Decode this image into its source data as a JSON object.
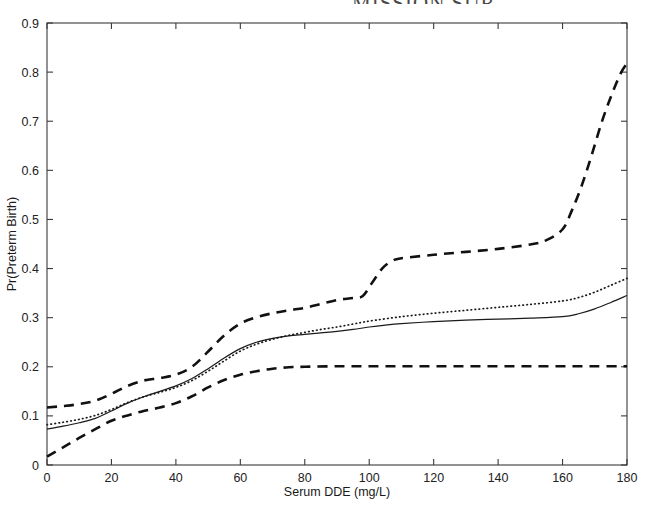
{
  "figure": {
    "cut_off_header": "MISSION SUR",
    "background_color": "#ffffff",
    "axis_color": "#3a3a3a"
  },
  "chart_data": {
    "type": "line",
    "title": "",
    "xlabel": "Serum DDE (mg/L)",
    "ylabel": "Pr(Preterm Birth)",
    "xlim": [
      0,
      180
    ],
    "ylim": [
      0,
      0.9
    ],
    "xticks": [
      0,
      20,
      40,
      60,
      80,
      100,
      120,
      140,
      160,
      180
    ],
    "xtick_labels": [
      "0",
      "20",
      "40",
      "60",
      "80",
      "100",
      "120",
      "140",
      "160",
      "180"
    ],
    "yticks": [
      0,
      0.1,
      0.2,
      0.3,
      0.4,
      0.5,
      0.6,
      0.7,
      0.8,
      0.9
    ],
    "ytick_labels": [
      "0",
      "0.1",
      "0.2",
      "0.3",
      "0.4",
      "0.5",
      "0.6",
      "0.7",
      "0.8",
      "0.9"
    ],
    "grid": false,
    "legend": false,
    "legend_position": "none",
    "series": [
      {
        "name": "Estimated dose-response (solid)",
        "style": "solid",
        "color": "#1a1a1a",
        "x": [
          0,
          5,
          10,
          15,
          20,
          25,
          30,
          35,
          40,
          45,
          50,
          55,
          60,
          65,
          70,
          75,
          80,
          85,
          90,
          95,
          100,
          105,
          110,
          120,
          130,
          140,
          150,
          160,
          165,
          170,
          175,
          180
        ],
        "y": [
          0.073,
          0.079,
          0.086,
          0.095,
          0.11,
          0.126,
          0.139,
          0.15,
          0.161,
          0.176,
          0.196,
          0.218,
          0.237,
          0.25,
          0.258,
          0.263,
          0.266,
          0.269,
          0.272,
          0.276,
          0.281,
          0.285,
          0.288,
          0.292,
          0.295,
          0.297,
          0.299,
          0.302,
          0.308,
          0.318,
          0.331,
          0.345
        ]
      },
      {
        "name": "Alternative estimate (dotted)",
        "style": "dotted",
        "color": "#1a1a1a",
        "x": [
          0,
          5,
          10,
          15,
          20,
          25,
          30,
          35,
          40,
          45,
          50,
          55,
          60,
          65,
          70,
          75,
          80,
          85,
          90,
          95,
          100,
          110,
          120,
          130,
          140,
          150,
          160,
          165,
          170,
          175,
          180
        ],
        "y": [
          0.082,
          0.087,
          0.093,
          0.101,
          0.113,
          0.127,
          0.139,
          0.148,
          0.158,
          0.172,
          0.191,
          0.212,
          0.232,
          0.246,
          0.256,
          0.264,
          0.27,
          0.276,
          0.281,
          0.287,
          0.293,
          0.302,
          0.309,
          0.315,
          0.321,
          0.327,
          0.334,
          0.341,
          0.352,
          0.366,
          0.38
        ]
      },
      {
        "name": "Upper confidence band (dashed)",
        "style": "dashed",
        "color": "#111111",
        "x": [
          0,
          5,
          10,
          15,
          20,
          25,
          30,
          35,
          40,
          45,
          50,
          55,
          60,
          65,
          70,
          75,
          80,
          85,
          90,
          95,
          98,
          101,
          104,
          107,
          110,
          120,
          130,
          140,
          150,
          155,
          160,
          163,
          166,
          169,
          172,
          175,
          178,
          180
        ],
        "y": [
          0.117,
          0.12,
          0.124,
          0.131,
          0.145,
          0.161,
          0.172,
          0.177,
          0.184,
          0.2,
          0.231,
          0.264,
          0.288,
          0.301,
          0.309,
          0.315,
          0.32,
          0.328,
          0.336,
          0.34,
          0.344,
          0.372,
          0.4,
          0.415,
          0.421,
          0.428,
          0.434,
          0.44,
          0.449,
          0.458,
          0.48,
          0.52,
          0.57,
          0.63,
          0.695,
          0.75,
          0.797,
          0.818
        ]
      },
      {
        "name": "Lower confidence band (dashed)",
        "style": "dashed",
        "color": "#111111",
        "x": [
          0,
          5,
          10,
          15,
          20,
          25,
          30,
          35,
          40,
          45,
          50,
          55,
          60,
          65,
          70,
          75,
          80,
          90,
          100,
          110,
          120,
          130,
          140,
          150,
          160,
          170,
          180
        ],
        "y": [
          0.017,
          0.036,
          0.055,
          0.073,
          0.09,
          0.101,
          0.11,
          0.117,
          0.126,
          0.14,
          0.158,
          0.173,
          0.184,
          0.191,
          0.196,
          0.199,
          0.2,
          0.201,
          0.201,
          0.201,
          0.201,
          0.201,
          0.201,
          0.201,
          0.201,
          0.201,
          0.201
        ]
      }
    ]
  }
}
